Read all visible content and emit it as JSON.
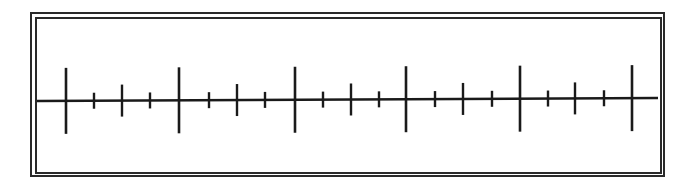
{
  "diagram": {
    "type": "number-line",
    "labels": [],
    "line": {
      "x_start": 37,
      "x_end": 658,
      "y_start": 101,
      "y_end": 98,
      "color": "#1a1a1a",
      "stroke_width": 2.4
    },
    "ticks": [
      {
        "x": 66,
        "kind": "major"
      },
      {
        "x": 94,
        "kind": "minor"
      },
      {
        "x": 122,
        "kind": "medium"
      },
      {
        "x": 150,
        "kind": "minor"
      },
      {
        "x": 179,
        "kind": "major"
      },
      {
        "x": 209,
        "kind": "minor"
      },
      {
        "x": 237,
        "kind": "medium"
      },
      {
        "x": 265,
        "kind": "minor"
      },
      {
        "x": 295,
        "kind": "major"
      },
      {
        "x": 323,
        "kind": "minor"
      },
      {
        "x": 351,
        "kind": "medium"
      },
      {
        "x": 379,
        "kind": "minor"
      },
      {
        "x": 406,
        "kind": "major"
      },
      {
        "x": 435,
        "kind": "minor"
      },
      {
        "x": 463,
        "kind": "medium"
      },
      {
        "x": 492,
        "kind": "minor"
      },
      {
        "x": 520,
        "kind": "major"
      },
      {
        "x": 548,
        "kind": "minor"
      },
      {
        "x": 575,
        "kind": "medium"
      },
      {
        "x": 604,
        "kind": "minor"
      },
      {
        "x": 632,
        "kind": "major"
      }
    ],
    "tick_half_heights": {
      "major": 33,
      "medium": 16,
      "minor": 8
    },
    "colors": {
      "ink": "#1a1a1a",
      "background": "#ffffff"
    }
  }
}
